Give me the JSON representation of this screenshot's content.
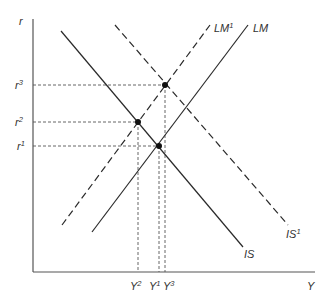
{
  "diagram": {
    "type": "IS-LM model",
    "colors": {
      "line": "#2a2a2a",
      "axis": "#555555",
      "guide": "#555555",
      "text": "#333333"
    },
    "axes": {
      "y": {
        "label": "r"
      },
      "x": {
        "label": "Y"
      }
    },
    "curves": [
      {
        "id": "IS",
        "base": "IS",
        "sup": "",
        "style": "solid"
      },
      {
        "id": "IS1",
        "base": "IS",
        "sup": "1",
        "style": "dashed"
      },
      {
        "id": "LM",
        "base": "LM",
        "sup": "",
        "style": "solid"
      },
      {
        "id": "LM1",
        "base": "LM",
        "sup": "1",
        "style": "dashed"
      }
    ],
    "equilibria": [
      {
        "id": "E1",
        "r": {
          "base": "r",
          "sup": "1"
        },
        "y": {
          "base": "Y",
          "sup": "1"
        },
        "curves": [
          "IS",
          "LM"
        ]
      },
      {
        "id": "E2",
        "r": {
          "base": "r",
          "sup": "2"
        },
        "y": {
          "base": "Y",
          "sup": "2"
        },
        "curves": [
          "IS",
          "LM1"
        ]
      },
      {
        "id": "E3",
        "r": {
          "base": "r",
          "sup": "3"
        },
        "y": {
          "base": "Y",
          "sup": "3"
        },
        "curves": [
          "IS1",
          "LM1"
        ]
      }
    ]
  }
}
